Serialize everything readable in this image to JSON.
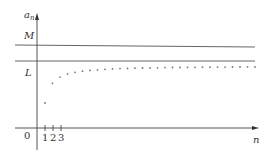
{
  "diagram": {
    "y_axis_label": "a",
    "y_axis_subscript": "n",
    "x_axis_label": "n",
    "origin_label": "0",
    "upper_bound_label": "M",
    "limit_label": "L",
    "tick_labels": [
      "1",
      "2",
      "3"
    ],
    "colors": {
      "axis": "#555555",
      "line": "#666666",
      "dot": "#777777",
      "text": "#333333"
    }
  },
  "chart_data": {
    "type": "scatter",
    "title": "",
    "xlabel": "n",
    "ylabel": "a_n",
    "horizontal_lines": [
      {
        "label": "M",
        "role": "upper bound"
      },
      {
        "label": "L",
        "role": "limit"
      }
    ],
    "x_ticks": [
      "1",
      "2",
      "3"
    ],
    "points_count": 30,
    "grid": false
  }
}
